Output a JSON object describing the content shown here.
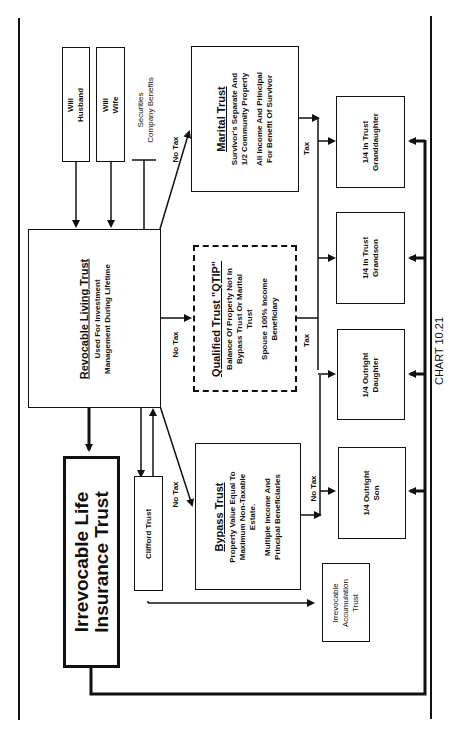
{
  "chart_caption": "CHART 10.21",
  "sources": {
    "will_husband": [
      "Will",
      "Husband"
    ],
    "will_wife": [
      "Will",
      "Wife"
    ],
    "securities": [
      "Securities",
      "Company Benefits"
    ]
  },
  "revocable_living_trust": {
    "title": "Revocable Living Trust",
    "lines": [
      "Used For Investment",
      "Management During Lifetime"
    ]
  },
  "irrevocable_life_insurance_trust": {
    "lines": [
      "Irrevocable Life",
      "Insurance Trust"
    ]
  },
  "clifford_trust": {
    "title": "Clifford Trust"
  },
  "marital_trust": {
    "title": "Marital Trust",
    "lines": [
      "Survivor's Separate And",
      "1/2 Community Property"
    ],
    "lines2": [
      "All Income And Principal",
      "For Benefit Of Survivor"
    ]
  },
  "qtip_trust": {
    "title": "Qualified Trust \"QTIP\"",
    "lines": [
      "Balance Of Property Not In",
      "Bypass Trust Or Marital",
      "Trust"
    ],
    "lines2": [
      "Spouse 100% Income",
      "Beneficiary"
    ]
  },
  "bypass_trust": {
    "title": "Bypass Trust",
    "lines": [
      "Property Value Equal To",
      "Maximum Non-Taxable",
      "Estate."
    ],
    "lines2": [
      "Multiple Income And",
      "Principal Beneficiaries"
    ]
  },
  "irrevocable_accumulation_trust": {
    "lines": [
      "Irrevocable",
      "Accumulation",
      "Trust"
    ]
  },
  "heirs": {
    "granddaughter": [
      "1/4 In Trust",
      "Granddaughter"
    ],
    "grandson": [
      "1/4 In Trust",
      "Grandson"
    ],
    "daughter": [
      "1/4 Outright",
      "Daughter"
    ],
    "son": [
      "1/4 Outright",
      "Son"
    ]
  },
  "edge_labels": {
    "no_tax_marital": "No Tax",
    "no_tax_qtip": "No Tax",
    "no_tax_bypass": "No Tax",
    "tax_marital": "Tax",
    "tax_qtip": "Tax",
    "no_tax_bypass_heirs": "No Tax"
  }
}
